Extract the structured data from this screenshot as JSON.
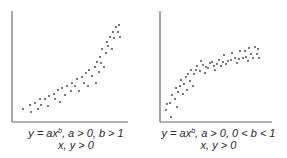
{
  "chart_data": [
    {
      "type": "scatter",
      "title": "",
      "caption_line1": "y = ax^b, a > 0, b > 1",
      "caption_line2": "x, y > 0",
      "xlabel": "",
      "ylabel": "",
      "grid": false,
      "trend": "convex increasing (power law, b > 1)",
      "points_px": [
        [
          23,
          109
        ],
        [
          30,
          105
        ],
        [
          31,
          112
        ],
        [
          35,
          103
        ],
        [
          38,
          109
        ],
        [
          40,
          99
        ],
        [
          41,
          105
        ],
        [
          45,
          99
        ],
        [
          48,
          106
        ],
        [
          49,
          96
        ],
        [
          54,
          94
        ],
        [
          55,
          99
        ],
        [
          58,
          90
        ],
        [
          60,
          102
        ],
        [
          62,
          88
        ],
        [
          65,
          95
        ],
        [
          67,
          86
        ],
        [
          71,
          91
        ],
        [
          72,
          83
        ],
        [
          75,
          86
        ],
        [
          77,
          79
        ],
        [
          79,
          91
        ],
        [
          82,
          77
        ],
        [
          84,
          83
        ],
        [
          86,
          73
        ],
        [
          88,
          86
        ],
        [
          89,
          70
        ],
        [
          92,
          76
        ],
        [
          95,
          67
        ],
        [
          96,
          83
        ],
        [
          97,
          62
        ],
        [
          99,
          72
        ],
        [
          100,
          57
        ],
        [
          101,
          63
        ],
        [
          102,
          49
        ],
        [
          104,
          67
        ],
        [
          106,
          53
        ],
        [
          107,
          42
        ],
        [
          108,
          46
        ],
        [
          110,
          37
        ],
        [
          112,
          49
        ],
        [
          113,
          32
        ],
        [
          114,
          38
        ],
        [
          116,
          27
        ],
        [
          118,
          32
        ],
        [
          119,
          25
        ],
        [
          120,
          37
        ]
      ]
    },
    {
      "type": "scatter",
      "title": "",
      "caption_line1": "y = ax^b, a > 0, 0 < b < 1",
      "caption_line2": "x, y > 0",
      "xlabel": "",
      "ylabel": "",
      "grid": false,
      "trend": "concave increasing (power law, 0 < b < 1)",
      "points_px": [
        [
          166,
          110
        ],
        [
          167,
          104
        ],
        [
          171,
          117
        ],
        [
          170,
          103
        ],
        [
          172,
          95
        ],
        [
          175,
          99
        ],
        [
          176,
          88
        ],
        [
          177,
          107
        ],
        [
          178,
          92
        ],
        [
          180,
          86
        ],
        [
          181,
          80
        ],
        [
          183,
          94
        ],
        [
          184,
          84
        ],
        [
          186,
          77
        ],
        [
          187,
          90
        ],
        [
          188,
          74
        ],
        [
          190,
          81
        ],
        [
          191,
          70
        ],
        [
          193,
          86
        ],
        [
          194,
          74
        ],
        [
          196,
          70
        ],
        [
          197,
          66
        ],
        [
          200,
          71
        ],
        [
          201,
          61
        ],
        [
          203,
          65
        ],
        [
          205,
          73
        ],
        [
          206,
          67
        ],
        [
          208,
          68
        ],
        [
          210,
          63
        ],
        [
          212,
          62
        ],
        [
          214,
          66
        ],
        [
          215,
          70
        ],
        [
          217,
          64
        ],
        [
          219,
          60
        ],
        [
          221,
          66
        ],
        [
          223,
          62
        ],
        [
          224,
          55
        ],
        [
          226,
          64
        ],
        [
          228,
          61
        ],
        [
          231,
          60
        ],
        [
          232,
          53
        ],
        [
          235,
          58
        ],
        [
          237,
          63
        ],
        [
          239,
          59
        ],
        [
          240,
          51
        ],
        [
          243,
          58
        ],
        [
          245,
          51
        ],
        [
          246,
          57
        ],
        [
          248,
          61
        ],
        [
          249,
          48
        ],
        [
          251,
          54
        ],
        [
          253,
          58
        ],
        [
          255,
          47
        ],
        [
          257,
          54
        ],
        [
          258,
          49
        ],
        [
          259,
          58
        ]
      ]
    }
  ],
  "captions": {
    "left": {
      "eq_y": "y",
      "eq_mid": " = ax",
      "eq_exp": "b",
      "eq_rest": ", a > 0, b > 1",
      "line2": "x, y > 0"
    },
    "right": {
      "eq_y": "y",
      "eq_mid": " = ax",
      "eq_exp": "b",
      "eq_rest": ", a > 0, 0 < b < 1",
      "line2": "x, y > 0"
    }
  },
  "colors": {
    "axis": "#6b6b6b",
    "dot": "#3a3a3a",
    "text": "#2a2a2a"
  }
}
